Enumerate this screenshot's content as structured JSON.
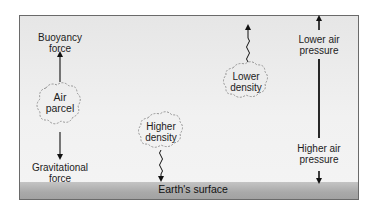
{
  "diagram": {
    "type": "air parcel buoyancy and pressure diagram",
    "ground_label": "Earth's surface",
    "parcels": [
      {
        "label_line1": "Air",
        "label_line2": "parcel"
      },
      {
        "label_line1": "Higher",
        "label_line2": "density"
      },
      {
        "label_line1": "Lower",
        "label_line2": "density"
      }
    ],
    "forces": {
      "up_line1": "Buoyancy",
      "up_line2": "force",
      "down_line1": "Gravitational",
      "down_line2": "force"
    },
    "pressure_axis": {
      "top_line1": "Lower air",
      "top_line2": "pressure",
      "bottom_line1": "Higher air",
      "bottom_line2": "pressure"
    },
    "colors": {
      "background_top": "#e6e6e6",
      "background_bottom": "#f4f4f4",
      "ground": "#a9a9a9",
      "line": "#111111",
      "parcel_outline": "#8a8a8a"
    }
  }
}
